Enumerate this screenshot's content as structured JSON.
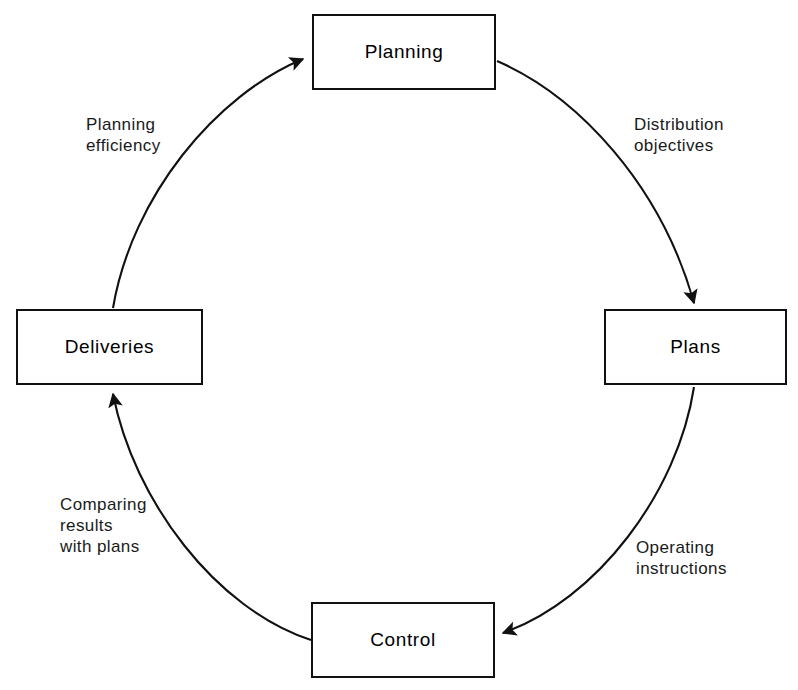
{
  "diagram": {
    "type": "cycle-flow-diagram",
    "background_color": "#ffffff",
    "line_color": "#111111",
    "nodes": [
      {
        "id": "planning",
        "label": "Planning",
        "position": "top"
      },
      {
        "id": "plans",
        "label": "Plans",
        "position": "right"
      },
      {
        "id": "control",
        "label": "Control",
        "position": "bottom"
      },
      {
        "id": "deliveries",
        "label": "Deliveries",
        "position": "left"
      }
    ],
    "edges": [
      {
        "id": "planning-to-plans",
        "from": "planning",
        "to": "plans",
        "label": "Distribution\nobjectives",
        "direction": "clockwise"
      },
      {
        "id": "plans-to-control",
        "from": "plans",
        "to": "control",
        "label": "Operating\ninstructions",
        "direction": "clockwise"
      },
      {
        "id": "control-to-deliveries",
        "from": "control",
        "to": "deliveries",
        "label": "Comparing\nresults\nwith plans",
        "direction": "clockwise"
      },
      {
        "id": "deliveries-to-planning",
        "from": "deliveries",
        "to": "planning",
        "label": "Planning\nefficiency",
        "direction": "clockwise"
      }
    ]
  }
}
